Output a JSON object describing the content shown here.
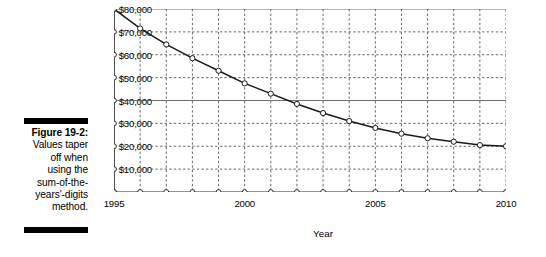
{
  "figure": {
    "number_label": "Figure 19-2:",
    "caption_lines": [
      "Values taper",
      "off when",
      "using the",
      "sum-of-the-",
      "years'-digits",
      "method."
    ]
  },
  "chart_data": {
    "type": "line",
    "title": "",
    "xlabel": "Year",
    "ylabel": "",
    "xlim": [
      1995,
      2010
    ],
    "ylim": [
      0,
      80000
    ],
    "grid": true,
    "legend": "none",
    "marker": "open-circle",
    "line_color": "#1a1a1a",
    "grid_color": "#4d4d4d",
    "x_tick_labels": [
      "1995",
      "2000",
      "2005",
      "2010"
    ],
    "x_tick_label_values": [
      1995,
      2000,
      2005,
      2010
    ],
    "y_tick_labels": [
      "$10,000",
      "$20,000",
      "$30,000",
      "$40,000",
      "$50,000",
      "$60,000",
      "$70,000",
      "$80,000"
    ],
    "y_tick_values": [
      10000,
      20000,
      30000,
      40000,
      50000,
      60000,
      70000,
      80000
    ],
    "x": [
      1995,
      1996,
      1997,
      1998,
      1999,
      2000,
      2001,
      2002,
      2003,
      2004,
      2005,
      2006,
      2007,
      2008,
      2009,
      2010
    ],
    "values": [
      80000,
      71500,
      64500,
      58500,
      53000,
      47500,
      43000,
      38500,
      34500,
      31000,
      28000,
      25500,
      23500,
      22000,
      20500,
      20000
    ]
  }
}
